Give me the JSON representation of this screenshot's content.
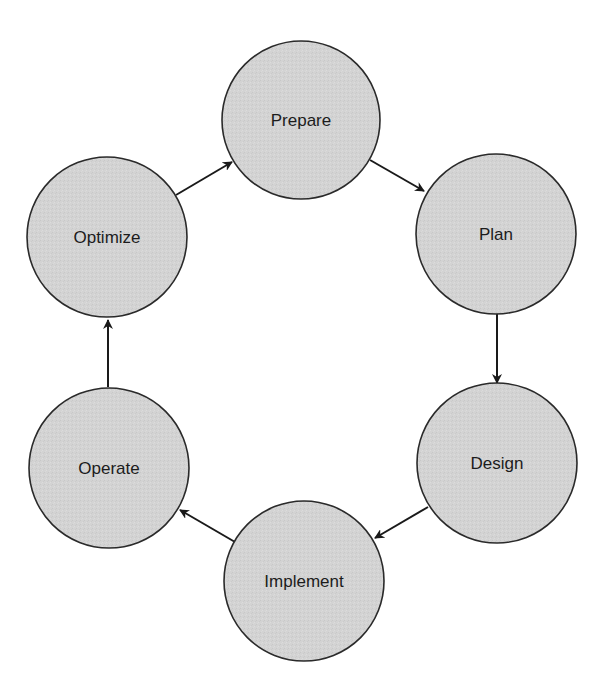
{
  "diagram": {
    "type": "cycle",
    "colors": {
      "node_fill": "#d3d3d3",
      "node_stroke": "#2a2a2a",
      "arrow": "#1a1a1a",
      "text": "#1c1c1c",
      "background": "#ffffff"
    },
    "nodes": [
      {
        "id": "prepare",
        "label": "Prepare",
        "cx": 301,
        "cy": 120,
        "r": 79
      },
      {
        "id": "plan",
        "label": "Plan",
        "cx": 496,
        "cy": 234,
        "r": 80
      },
      {
        "id": "design",
        "label": "Design",
        "cx": 497,
        "cy": 463,
        "r": 80
      },
      {
        "id": "implement",
        "label": "Implement",
        "cx": 304,
        "cy": 581,
        "r": 80
      },
      {
        "id": "operate",
        "label": "Operate",
        "cx": 109,
        "cy": 468,
        "r": 80
      },
      {
        "id": "optimize",
        "label": "Optimize",
        "cx": 107,
        "cy": 237,
        "r": 80
      }
    ],
    "edges": [
      {
        "from": "prepare",
        "to": "plan",
        "x1": 370,
        "y1": 160,
        "x2": 424,
        "y2": 191
      },
      {
        "from": "plan",
        "to": "design",
        "x1": 497,
        "y1": 314,
        "x2": 497,
        "y2": 383
      },
      {
        "from": "design",
        "to": "implement",
        "x1": 428,
        "y1": 507,
        "x2": 375,
        "y2": 538
      },
      {
        "from": "implement",
        "to": "operate",
        "x1": 235,
        "y1": 542,
        "x2": 180,
        "y2": 510
      },
      {
        "from": "operate",
        "to": "optimize",
        "x1": 108,
        "y1": 387,
        "x2": 108,
        "y2": 320
      },
      {
        "from": "optimize",
        "to": "prepare",
        "x1": 176,
        "y1": 195,
        "x2": 232,
        "y2": 162
      }
    ]
  }
}
